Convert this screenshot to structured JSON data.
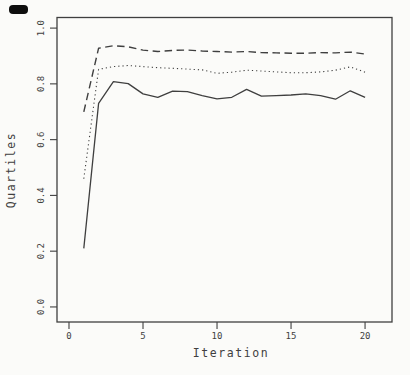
{
  "window": {
    "width": 410,
    "height": 375
  },
  "figure": {
    "background": "#fbfbf9",
    "ink_color": "#3f3f3f",
    "scan_mark_color": "#0e0e0e"
  },
  "chart_data": {
    "type": "line",
    "title": "",
    "xlabel": "Iteration",
    "ylabel": "Quartiles",
    "x": [
      1,
      2,
      3,
      4,
      5,
      6,
      7,
      8,
      9,
      10,
      11,
      12,
      13,
      14,
      15,
      16,
      17,
      18,
      19,
      20
    ],
    "series": [
      {
        "name": "solid-line-lower-quartile",
        "style": "solid",
        "values": [
          0.21,
          0.73,
          0.808,
          0.801,
          0.764,
          0.752,
          0.774,
          0.772,
          0.758,
          0.746,
          0.752,
          0.78,
          0.756,
          0.758,
          0.76,
          0.764,
          0.758,
          0.745,
          0.775,
          0.752
        ]
      },
      {
        "name": "dotted-line-median",
        "style": "dotted",
        "values": [
          0.46,
          0.852,
          0.862,
          0.866,
          0.862,
          0.858,
          0.856,
          0.853,
          0.85,
          0.838,
          0.842,
          0.849,
          0.846,
          0.843,
          0.84,
          0.84,
          0.843,
          0.849,
          0.861,
          0.842
        ]
      },
      {
        "name": "dashed-line-upper-quartile",
        "style": "dashed",
        "values": [
          0.7,
          0.928,
          0.937,
          0.933,
          0.921,
          0.916,
          0.92,
          0.921,
          0.918,
          0.916,
          0.914,
          0.916,
          0.912,
          0.911,
          0.91,
          0.91,
          0.912,
          0.911,
          0.914,
          0.907
        ]
      }
    ],
    "xticks": [
      0,
      5,
      10,
      15,
      20
    ],
    "xtick_labels": [
      "0",
      "5",
      "10",
      "15",
      "20"
    ],
    "yticks": [
      0.0,
      0.2,
      0.4,
      0.6,
      0.8,
      1.0
    ],
    "ytick_labels": [
      "0.0",
      "0.2",
      "0.4",
      "0.6",
      "0.8",
      "1.0"
    ],
    "xlim": [
      -0.81,
      21.82
    ],
    "ylim": [
      -0.054,
      1.038
    ],
    "grid": false,
    "legend": "none",
    "line_styles": {
      "solid": "",
      "dotted": "1.2 3",
      "dashed": "7.5 4.5"
    }
  }
}
